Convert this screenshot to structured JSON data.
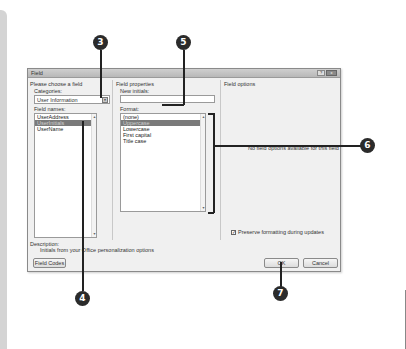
{
  "dialog": {
    "title": "Field",
    "help_button": "?",
    "close_button": "x",
    "left": {
      "group_label": "Please choose a field",
      "categories_label": "Categories:",
      "categories_value": "User Information",
      "field_names_label": "Field names:",
      "field_names": [
        "UserAddress",
        "UserInitials",
        "UserName"
      ],
      "selected_index": 1
    },
    "middle": {
      "group_label": "Field properties",
      "new_initials_label": "New initials:",
      "new_initials_value": "",
      "format_label": "Format:",
      "formats": [
        "(none)",
        "Uppercase",
        "Lowercase",
        "First capital",
        "Title case"
      ],
      "selected_index": 1
    },
    "right": {
      "group_label": "Field options",
      "no_options_text": "No field options available for this field",
      "preserve_label": "Preserve formatting during updates",
      "preserve_checked": true
    },
    "description_label": "Description:",
    "description_text": "Initials from your Office personalization options",
    "field_codes_button": "Field Codes",
    "ok_button": "OK",
    "cancel_button": "Cancel"
  },
  "callouts": [
    "3",
    "5",
    "6",
    "4",
    "7"
  ],
  "check_glyph": "✓",
  "scroll_up_glyph": "▲",
  "scroll_down_glyph": "▼",
  "dropdown_glyph": "▼"
}
